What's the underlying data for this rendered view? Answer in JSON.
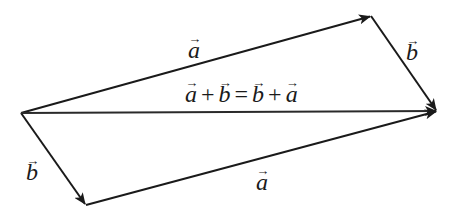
{
  "diagram": {
    "type": "vector-parallelogram",
    "vertices": {
      "origin": [
        21,
        113
      ],
      "top_right": [
        371,
        16
      ],
      "right": [
        437,
        111
      ],
      "bottom": [
        86,
        205
      ]
    },
    "vectors": [
      {
        "id": "a-top",
        "name": "a",
        "from": "origin",
        "to": "top_right"
      },
      {
        "id": "b-right",
        "name": "b",
        "from": "top_right",
        "to": "right"
      },
      {
        "id": "b-left",
        "name": "b",
        "from": "origin",
        "to": "bottom"
      },
      {
        "id": "a-bottom",
        "name": "a",
        "from": "bottom",
        "to": "right"
      },
      {
        "id": "sum",
        "name": "a+b",
        "from": "origin",
        "to": "right"
      }
    ],
    "labels": {
      "a_top": "a",
      "b_right": "b",
      "b_left": "b",
      "a_bottom": "a",
      "arrow_glyph": "→",
      "equation": {
        "t1": "a",
        "op1": "+",
        "t2": "b",
        "eq": "=",
        "t3": "b",
        "op2": "+",
        "t4": "a"
      }
    },
    "colors": {
      "stroke": "#1a1a1a",
      "background": "#ffffff"
    }
  }
}
